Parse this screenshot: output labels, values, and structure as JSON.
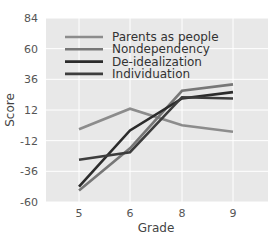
{
  "chart_data": {
    "type": "line",
    "title": "",
    "xlabel": "Grade",
    "ylabel": "Score",
    "categories": [
      "5",
      "6",
      "8",
      "9"
    ],
    "yticks": [
      84,
      60,
      36,
      12,
      -12,
      -36,
      -60
    ],
    "ylim": [
      -60,
      84
    ],
    "grid": true,
    "legend_position": "upper left (inside)",
    "series": [
      {
        "name": "Parents as people",
        "color": "#8c8c8c",
        "values": [
          -3,
          13,
          0,
          -5
        ]
      },
      {
        "name": "Nondependency",
        "color": "#777777",
        "values": [
          -51,
          -18,
          27,
          32
        ]
      },
      {
        "name": "De-idealization",
        "color": "#2b2b2b",
        "values": [
          -48,
          -4,
          21,
          26
        ]
      },
      {
        "name": "Individuation",
        "color": "#3d3d3d",
        "values": [
          -27,
          -21,
          22,
          21
        ]
      }
    ]
  },
  "colors": {
    "panel_background": "#e8e8e8",
    "gridline": "#ffffff"
  }
}
